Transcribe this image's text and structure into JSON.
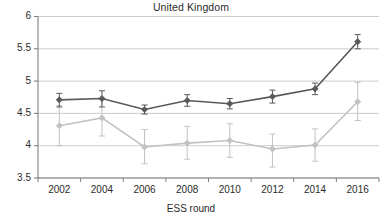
{
  "chart_data": {
    "type": "line",
    "title": "United Kingdom",
    "xlabel": "ESS round",
    "ylabel": "",
    "categories": [
      "2002",
      "2004",
      "2006",
      "2008",
      "2010",
      "2012",
      "2014",
      "2016"
    ],
    "x": [
      2002,
      2004,
      2006,
      2008,
      2010,
      2012,
      2014,
      2016
    ],
    "ylim": [
      3.5,
      6
    ],
    "yticks": [
      3.5,
      4,
      4.5,
      5,
      5.5,
      6
    ],
    "ytick_labels": [
      "3.5",
      "4",
      "4.5",
      "5",
      "5.5",
      "6"
    ],
    "grid": true,
    "legend": "none",
    "error_bars": true,
    "series": [
      {
        "name": "series-dark",
        "color": "#595959",
        "marker": "diamond",
        "values": [
          4.71,
          4.73,
          4.56,
          4.7,
          4.65,
          4.76,
          4.88,
          5.61
        ],
        "err_low": [
          4.6,
          4.6,
          4.49,
          4.61,
          4.57,
          4.66,
          4.79,
          5.5
        ],
        "err_high": [
          4.81,
          4.85,
          4.63,
          4.79,
          4.73,
          4.86,
          4.97,
          5.72
        ]
      },
      {
        "name": "series-light",
        "color": "#c2c2c2",
        "marker": "diamond",
        "values": [
          4.31,
          4.43,
          3.98,
          4.04,
          4.08,
          3.95,
          4.01,
          4.68
        ],
        "err_low": [
          4.0,
          4.15,
          3.72,
          3.79,
          3.82,
          3.67,
          3.76,
          4.39
        ],
        "err_high": [
          4.62,
          4.72,
          4.25,
          4.3,
          4.34,
          4.18,
          4.26,
          4.98
        ]
      }
    ]
  },
  "axes": {
    "y_axis_line_color": "#7f7f7f",
    "x_axis_line_color": "#7f7f7f",
    "grid_color": "#bfbfbf"
  }
}
